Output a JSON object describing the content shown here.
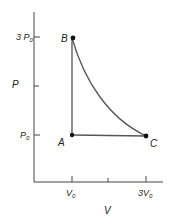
{
  "diagram": {
    "type": "pv-diagram",
    "axes": {
      "y_label": "P",
      "x_label": "V",
      "y_ticks": [
        {
          "label_main": "3 P",
          "label_sub": "0",
          "value": "3P0"
        },
        {
          "label_main": "",
          "label_sub": "",
          "value": "2P0"
        },
        {
          "label_main": "P",
          "label_sub": "0",
          "value": "P0"
        }
      ],
      "x_ticks": [
        {
          "label_main": "V",
          "label_sub": "0",
          "value": "V0"
        },
        {
          "label_main": "",
          "label_sub": "",
          "value": "2V0"
        },
        {
          "label_main": "3V",
          "label_sub": "0",
          "value": "3V0"
        }
      ]
    },
    "points": [
      {
        "name": "A",
        "V": "V0",
        "P": "P0"
      },
      {
        "name": "B",
        "V": "V0",
        "P": "3P0"
      },
      {
        "name": "C",
        "V": "3V0",
        "P": "P0"
      }
    ],
    "segments": [
      {
        "from": "A",
        "to": "B",
        "kind": "vertical line (isochoric)"
      },
      {
        "from": "B",
        "to": "C",
        "kind": "curve (isothermal)"
      },
      {
        "from": "C",
        "to": "A",
        "kind": "horizontal line (isobaric)"
      }
    ],
    "colors": {
      "line": "#333333",
      "axis": "#444444",
      "point": "#111111"
    }
  }
}
